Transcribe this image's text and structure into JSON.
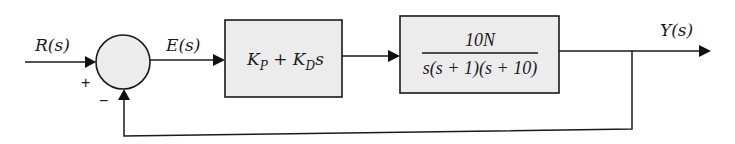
{
  "diagram": {
    "type": "closed-loop feedback block diagram",
    "input": {
      "label": "R(s)"
    },
    "summing_junction": {
      "plus_sign": "+",
      "minus_sign": "−"
    },
    "error": {
      "label": "E(s)"
    },
    "controller": {
      "label": "K_P + K_D s",
      "parts": {
        "k1": "K",
        "s1": "P",
        "plus": " + ",
        "k2": "K",
        "s2": "D",
        "var": "s"
      }
    },
    "plant": {
      "numerator": "10N",
      "denominator": "s(s + 1)(s + 10)"
    },
    "output": {
      "label": "Y(s)"
    },
    "feedback": {
      "type": "unity negative feedback"
    },
    "colors": {
      "block_fill": "#ececec",
      "stroke": "#1a1a1a",
      "background": "#ffffff"
    }
  }
}
